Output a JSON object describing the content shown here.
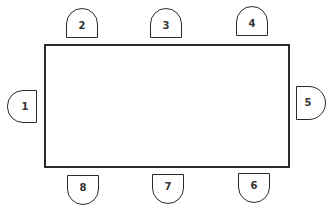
{
  "diagram": {
    "type": "seating-arrangement",
    "table": {
      "shape": "rectangle",
      "label": ""
    },
    "chairs": [
      {
        "label": "1",
        "side": "left"
      },
      {
        "label": "2",
        "side": "top"
      },
      {
        "label": "3",
        "side": "top"
      },
      {
        "label": "4",
        "side": "top"
      },
      {
        "label": "5",
        "side": "right"
      },
      {
        "label": "6",
        "side": "bottom"
      },
      {
        "label": "7",
        "side": "bottom"
      },
      {
        "label": "8",
        "side": "bottom"
      }
    ],
    "colors": {
      "stroke": "#2a2a2a",
      "background": "#ffffff",
      "text": "#333333"
    }
  }
}
